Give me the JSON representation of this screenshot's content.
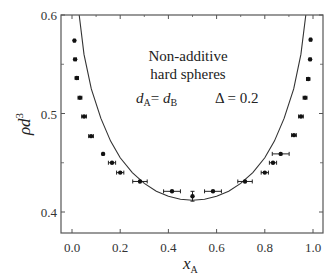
{
  "chart_data": {
    "type": "scatter",
    "title": "",
    "annotation": {
      "line1": "Non-additive",
      "line2": "hard spheres",
      "condition_d": "d_A = d_B",
      "condition_delta": "Δ = 0.2"
    },
    "xlabel": "x_A",
    "ylabel": "ρd^3",
    "xlim": [
      -0.05,
      1.05
    ],
    "ylim": [
      0.385,
      0.6
    ],
    "xticks": [
      0.0,
      0.2,
      0.4,
      0.6,
      0.8,
      1.0
    ],
    "xtick_labels": [
      "0.0",
      "0.2",
      "0.4",
      "0.6",
      "0.8",
      "1.0"
    ],
    "yticks": [
      0.4,
      0.5,
      0.6
    ],
    "ytick_labels": [
      "0.4",
      "0.5",
      "0.6"
    ],
    "grid": false,
    "legend": null,
    "series": [
      {
        "name": "simulation points",
        "style": "filled circles with horizontal error bars",
        "points": [
          {
            "x": 0.01,
            "y": 0.574,
            "xerr": 0.003
          },
          {
            "x": 0.013,
            "y": 0.555,
            "xerr": 0.005
          },
          {
            "x": 0.02,
            "y": 0.536,
            "xerr": 0.007
          },
          {
            "x": 0.033,
            "y": 0.516,
            "xerr": 0.008
          },
          {
            "x": 0.05,
            "y": 0.497,
            "xerr": 0.01
          },
          {
            "x": 0.079,
            "y": 0.477,
            "xerr": 0.01
          },
          {
            "x": 0.129,
            "y": 0.459,
            "xerr": 0.003
          },
          {
            "x": 0.166,
            "y": 0.45,
            "xerr": 0.015
          },
          {
            "x": 0.2,
            "y": 0.44,
            "xerr": 0.015
          },
          {
            "x": 0.282,
            "y": 0.431,
            "xerr": 0.03
          },
          {
            "x": 0.415,
            "y": 0.421,
            "xerr": 0.035
          },
          {
            "x": 0.5,
            "y": 0.416,
            "yerr": 0.005
          },
          {
            "x": 0.585,
            "y": 0.421,
            "xerr": 0.035
          },
          {
            "x": 0.718,
            "y": 0.431,
            "xerr": 0.03
          },
          {
            "x": 0.8,
            "y": 0.44,
            "xerr": 0.015
          },
          {
            "x": 0.834,
            "y": 0.45,
            "xerr": 0.015
          },
          {
            "x": 0.866,
            "y": 0.459,
            "xerr": 0.035
          },
          {
            "x": 0.921,
            "y": 0.478,
            "xerr": 0.01
          },
          {
            "x": 0.95,
            "y": 0.497,
            "xerr": 0.01
          },
          {
            "x": 0.967,
            "y": 0.516,
            "xerr": 0.008
          },
          {
            "x": 0.98,
            "y": 0.535,
            "xerr": 0.007
          },
          {
            "x": 0.988,
            "y": 0.555,
            "xerr": 0.004
          },
          {
            "x": 0.99,
            "y": 0.575,
            "xerr": 0.003
          }
        ]
      },
      {
        "name": "theory curve",
        "style": "solid line",
        "points": [
          {
            "x": 0.03,
            "y": 0.6
          },
          {
            "x": 0.05,
            "y": 0.56
          },
          {
            "x": 0.08,
            "y": 0.525
          },
          {
            "x": 0.12,
            "y": 0.495
          },
          {
            "x": 0.16,
            "y": 0.472
          },
          {
            "x": 0.2,
            "y": 0.455
          },
          {
            "x": 0.25,
            "y": 0.44
          },
          {
            "x": 0.3,
            "y": 0.429
          },
          {
            "x": 0.35,
            "y": 0.421
          },
          {
            "x": 0.4,
            "y": 0.416
          },
          {
            "x": 0.45,
            "y": 0.413
          },
          {
            "x": 0.5,
            "y": 0.412
          },
          {
            "x": 0.55,
            "y": 0.413
          },
          {
            "x": 0.6,
            "y": 0.416
          },
          {
            "x": 0.65,
            "y": 0.421
          },
          {
            "x": 0.7,
            "y": 0.429
          },
          {
            "x": 0.75,
            "y": 0.44
          },
          {
            "x": 0.8,
            "y": 0.455
          },
          {
            "x": 0.84,
            "y": 0.472
          },
          {
            "x": 0.88,
            "y": 0.495
          },
          {
            "x": 0.92,
            "y": 0.525
          },
          {
            "x": 0.95,
            "y": 0.56
          },
          {
            "x": 0.97,
            "y": 0.6
          }
        ]
      }
    ]
  }
}
